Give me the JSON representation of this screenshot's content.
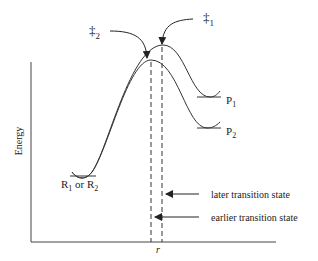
{
  "diagram": {
    "axes": {
      "ylabel": "Energy",
      "xlabel": "r"
    },
    "transition_states": [
      {
        "symbol": "‡",
        "subscript": "1"
      },
      {
        "symbol": "‡",
        "subscript": "2"
      }
    ],
    "reactant_label": {
      "prefix": "R",
      "sub1": "1",
      "mid": " or R",
      "sub2": "2"
    },
    "products": [
      {
        "letter": "P",
        "subscript": "1"
      },
      {
        "letter": "P",
        "subscript": "2"
      }
    ],
    "annotations": {
      "later": "later transition state",
      "earlier": "earlier transition state"
    },
    "colors": {
      "line": "#333333",
      "text": "#222222"
    }
  }
}
